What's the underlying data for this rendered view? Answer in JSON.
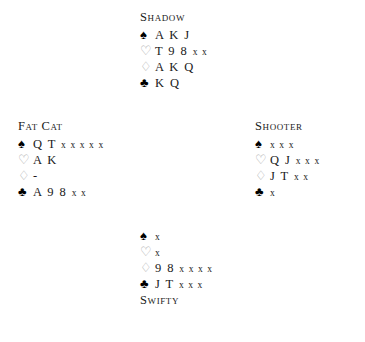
{
  "diagram": {
    "type": "bridge-hand-diagram",
    "suit_symbols": {
      "spades": "♠",
      "hearts": "♡",
      "diamonds": "♢",
      "clubs": "♣"
    },
    "hands": {
      "north": {
        "player": "Shadow",
        "position": "north",
        "suits": [
          {
            "suit": "spades",
            "icon": "spade-icon",
            "style": "black",
            "honours": "A K J",
            "spots": ""
          },
          {
            "suit": "hearts",
            "icon": "heart-icon",
            "style": "outline",
            "honours": "T 9 8",
            "spots": "x x"
          },
          {
            "suit": "diamonds",
            "icon": "diamond-icon",
            "style": "outline",
            "honours": "A K Q",
            "spots": ""
          },
          {
            "suit": "clubs",
            "icon": "club-icon",
            "style": "black",
            "honours": "K Q",
            "spots": ""
          }
        ]
      },
      "west": {
        "player": "Fat Cat",
        "position": "west",
        "suits": [
          {
            "suit": "spades",
            "icon": "spade-icon",
            "style": "black",
            "honours": "Q T",
            "spots": "x x x x x"
          },
          {
            "suit": "hearts",
            "icon": "heart-icon",
            "style": "outline",
            "honours": "A K",
            "spots": ""
          },
          {
            "suit": "diamonds",
            "icon": "diamond-icon",
            "style": "outline",
            "honours": "-",
            "spots": ""
          },
          {
            "suit": "clubs",
            "icon": "club-icon",
            "style": "black",
            "honours": "A 9 8",
            "spots": "x x"
          }
        ]
      },
      "east": {
        "player": "Shooter",
        "position": "east",
        "suits": [
          {
            "suit": "spades",
            "icon": "spade-icon",
            "style": "black",
            "honours": "",
            "spots": "x x x"
          },
          {
            "suit": "hearts",
            "icon": "heart-icon",
            "style": "outline",
            "honours": "Q J",
            "spots": "x x x"
          },
          {
            "suit": "diamonds",
            "icon": "diamond-icon",
            "style": "outline",
            "honours": "J T",
            "spots": "x x"
          },
          {
            "suit": "clubs",
            "icon": "club-icon",
            "style": "black",
            "honours": "",
            "spots": "x"
          }
        ]
      },
      "south": {
        "player": "Swifty",
        "position": "south",
        "suits": [
          {
            "suit": "spades",
            "icon": "spade-icon",
            "style": "black",
            "honours": "",
            "spots": "x"
          },
          {
            "suit": "hearts",
            "icon": "heart-icon",
            "style": "outline",
            "honours": "",
            "spots": "x"
          },
          {
            "suit": "diamonds",
            "icon": "diamond-icon",
            "style": "outline",
            "honours": "9 8",
            "spots": "x x x x"
          },
          {
            "suit": "clubs",
            "icon": "club-icon",
            "style": "black",
            "honours": "J T",
            "spots": "x x x"
          }
        ]
      }
    }
  }
}
